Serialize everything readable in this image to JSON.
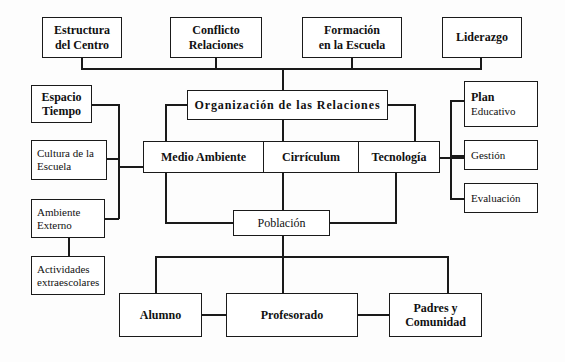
{
  "diagram": {
    "title": "Organización de las Relaciones",
    "language": "es",
    "style": {
      "line_color": "#1a1a1a",
      "box_fill": "#ffffff",
      "background": "#fdfdfd",
      "text_color": "#111111"
    },
    "nodes": {
      "estructura_centro": {
        "line1": "Estructura",
        "line2": "del Centro"
      },
      "conflicto_relaciones": {
        "line1": "Conflicto",
        "line2": "Relaciones"
      },
      "formacion_escuela": {
        "line1": "Formación",
        "line2": "en la Escuela"
      },
      "liderazgo": {
        "line1": "Liderazgo"
      },
      "espacio_tiempo": {
        "line1": "Espacio",
        "line2": "Tiempo"
      },
      "cultura_escuela": {
        "line1": "Cultura de la",
        "line2": "Escuela"
      },
      "ambiente_externo": {
        "line1": "Ambiente",
        "line2": "Externo"
      },
      "actividades_extraescolares": {
        "line1": "Actividades",
        "line2": "extraescolares"
      },
      "organizacion_relaciones": {
        "line1": "Organización de las Relaciones"
      },
      "medio_ambiente": {
        "line1": "Medio Ambiente"
      },
      "curriculum": {
        "line1": "Cirrículum"
      },
      "tecnologia": {
        "line1": "Tecnología"
      },
      "plan_educativo": {
        "line1": "Plan",
        "line2": "Educativo"
      },
      "gestion": {
        "line1": "Gestión"
      },
      "evaluacion": {
        "line1": "Evaluación"
      },
      "poblacion": {
        "line1": "Población"
      },
      "alumno": {
        "line1": "Alumno"
      },
      "profesorado": {
        "line1": "Profesorado"
      },
      "padres_comunidad": {
        "line1": "Padres y",
        "line2": "Comunidad"
      }
    },
    "edges": [
      "estructura-centro -> top-bus",
      "conflicto-relaciones -> top-bus",
      "formacion-escuela -> top-bus",
      "liderazgo -> top-bus",
      "top-bus -> organizacion-relaciones",
      "organizacion-relaciones -> medio-ambiente",
      "organizacion-relaciones -> curriculum",
      "organizacion-relaciones -> tecnologia",
      "espacio-tiempo -> left-bus",
      "cultura-escuela -> left-bus",
      "ambiente-externo -> left-bus",
      "left-bus -> medio-ambiente",
      "ambiente-externo -> actividades-extraescolares",
      "tecnologia -> right-bus",
      "right-bus -> plan-educativo",
      "right-bus -> gestion",
      "right-bus -> evaluacion",
      "medio-ambiente -> poblacion",
      "curriculum -> poblacion",
      "tecnologia -> poblacion",
      "poblacion -> bottom-bus",
      "bottom-bus -> alumno",
      "bottom-bus -> profesorado",
      "bottom-bus -> padres-comunidad",
      "alumno -- profesorado",
      "profesorado -- padres-comunidad"
    ]
  }
}
